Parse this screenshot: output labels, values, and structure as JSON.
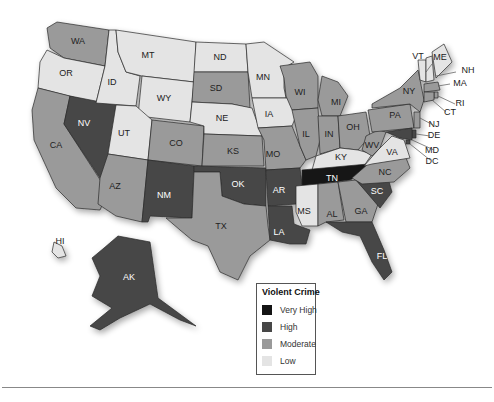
{
  "map": {
    "title": "Violent Crime",
    "colors": {
      "very_high": "#141414",
      "high": "#474747",
      "moderate": "#9a9a9a",
      "low": "#e4e4e4"
    },
    "states": {
      "WA": "moderate",
      "OR": "low",
      "CA": "moderate",
      "NV": "high",
      "ID": "low",
      "MT": "low",
      "WY": "low",
      "UT": "low",
      "AZ": "moderate",
      "CO": "moderate",
      "NM": "high",
      "ND": "low",
      "SD": "moderate",
      "NE": "low",
      "KS": "moderate",
      "OK": "high",
      "TX": "moderate",
      "MN": "low",
      "IA": "low",
      "MO": "moderate",
      "AR": "high",
      "LA": "high",
      "WI": "moderate",
      "IL": "moderate",
      "MI": "moderate",
      "IN": "moderate",
      "OH": "moderate",
      "KY": "low",
      "TN": "very_high",
      "MS": "low",
      "AL": "moderate",
      "GA": "moderate",
      "FL": "high",
      "SC": "high",
      "NC": "moderate",
      "VA": "low",
      "WV": "moderate",
      "PA": "moderate",
      "NY": "moderate",
      "VT": "low",
      "NH": "low",
      "ME": "low",
      "MA": "moderate",
      "RI": "moderate",
      "CT": "moderate",
      "NJ": "moderate",
      "DE": "high",
      "MD": "high",
      "DC": "high",
      "AK": "high",
      "HI": "low"
    },
    "labels": {
      "WA": "WA",
      "OR": "OR",
      "CA": "CA",
      "NV": "NV",
      "ID": "ID",
      "MT": "MT",
      "WY": "WY",
      "UT": "UT",
      "AZ": "AZ",
      "CO": "CO",
      "NM": "NM",
      "ND": "ND",
      "SD": "SD",
      "NE": "NE",
      "KS": "KS",
      "OK": "OK",
      "TX": "TX",
      "MN": "MN",
      "IA": "IA",
      "MO": "MO",
      "AR": "AR",
      "LA": "LA",
      "WI": "WI",
      "IL": "IL",
      "MI": "MI",
      "IN": "IN",
      "OH": "OH",
      "KY": "KY",
      "TN": "TN",
      "MS": "MS",
      "AL": "AL",
      "GA": "GA",
      "FL": "FL",
      "SC": "SC",
      "NC": "NC",
      "VA": "VA",
      "WV": "WV",
      "PA": "PA",
      "NY": "NY",
      "VT": "VT",
      "NH": "NH",
      "ME": "ME",
      "MA": "MA",
      "RI": "RI",
      "CT": "CT",
      "NJ": "NJ",
      "DE": "DE",
      "MD": "MD",
      "DC": "DC",
      "AK": "AK",
      "HI": "HI"
    }
  },
  "legend": {
    "title": "Violent Crime",
    "items": [
      {
        "label": "Very High",
        "color": "#141414"
      },
      {
        "label": "High",
        "color": "#474747"
      },
      {
        "label": "Moderate",
        "color": "#9a9a9a"
      },
      {
        "label": "Low",
        "color": "#e4e4e4"
      }
    ]
  }
}
